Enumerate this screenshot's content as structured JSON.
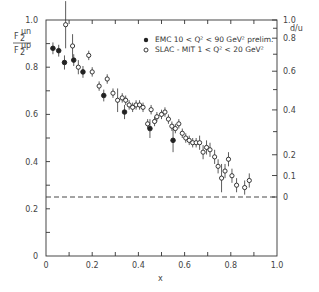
{
  "chart_data": {
    "type": "scatter",
    "title": "",
    "xlabel": "x",
    "ylabel": "F2^μn / F2^μp",
    "ylabel_num": "F",
    "ylabel_num_sub": "2",
    "ylabel_num_sup": "μn",
    "ylabel_den": "F",
    "ylabel_den_sub": "2",
    "ylabel_den_sup": "μp",
    "y2label": "d/u",
    "xlim": [
      0,
      1.0
    ],
    "ylim": [
      0,
      1.0
    ],
    "grid": false,
    "x_ticks": [
      "0",
      "0.2",
      "0.4",
      "0.6",
      "0.8",
      "1.0"
    ],
    "y_ticks": [
      "0",
      "0.2",
      "0.4",
      "0.6",
      "0.8",
      "1.0"
    ],
    "y2_ticks": [
      {
        "label": "1.0",
        "y": 1.0
      },
      {
        "label": "0.8",
        "y": 0.923
      },
      {
        "label": "0.6",
        "y": 0.783
      },
      {
        "label": "0.4",
        "y": 0.619
      },
      {
        "label": "0.2",
        "y": 0.429
      },
      {
        "label": "0.1",
        "y": 0.341
      },
      {
        "label": "0",
        "y": 0.25
      }
    ],
    "reference_line": {
      "y": 0.25,
      "style": "dashed"
    },
    "legend_position": "upper right",
    "series": [
      {
        "name": "EMC  10 < Q² < 90 GeV² prelim.",
        "marker": "filled-circle",
        "points": [
          {
            "x": 0.03,
            "y": 0.88,
            "err": 0.025
          },
          {
            "x": 0.055,
            "y": 0.87,
            "err": 0.025
          },
          {
            "x": 0.08,
            "y": 0.82,
            "err": 0.03
          },
          {
            "x": 0.12,
            "y": 0.83,
            "err": 0.025
          },
          {
            "x": 0.16,
            "y": 0.78,
            "err": 0.025
          },
          {
            "x": 0.25,
            "y": 0.68,
            "err": 0.025
          },
          {
            "x": 0.34,
            "y": 0.61,
            "err": 0.03
          },
          {
            "x": 0.45,
            "y": 0.54,
            "err": 0.04
          },
          {
            "x": 0.55,
            "y": 0.49,
            "err": 0.05
          }
        ]
      },
      {
        "name": "SLAC-MIT  1 < Q² < 20 GeV²",
        "marker": "open-circle",
        "points": [
          {
            "x": 0.085,
            "y": 0.98,
            "err": 0.1
          },
          {
            "x": 0.115,
            "y": 0.89,
            "err": 0.05
          },
          {
            "x": 0.14,
            "y": 0.8,
            "err": 0.03
          },
          {
            "x": 0.185,
            "y": 0.85,
            "err": 0.02
          },
          {
            "x": 0.2,
            "y": 0.78,
            "err": 0.02
          },
          {
            "x": 0.23,
            "y": 0.72,
            "err": 0.02
          },
          {
            "x": 0.265,
            "y": 0.75,
            "err": 0.02
          },
          {
            "x": 0.29,
            "y": 0.69,
            "err": 0.02
          },
          {
            "x": 0.31,
            "y": 0.66,
            "err": 0.05
          },
          {
            "x": 0.33,
            "y": 0.67,
            "err": 0.02
          },
          {
            "x": 0.345,
            "y": 0.66,
            "err": 0.02
          },
          {
            "x": 0.36,
            "y": 0.64,
            "err": 0.02
          },
          {
            "x": 0.375,
            "y": 0.63,
            "err": 0.02
          },
          {
            "x": 0.39,
            "y": 0.64,
            "err": 0.02
          },
          {
            "x": 0.405,
            "y": 0.64,
            "err": 0.02
          },
          {
            "x": 0.42,
            "y": 0.63,
            "err": 0.02
          },
          {
            "x": 0.44,
            "y": 0.56,
            "err": 0.02
          },
          {
            "x": 0.455,
            "y": 0.62,
            "err": 0.02
          },
          {
            "x": 0.47,
            "y": 0.57,
            "err": 0.02
          },
          {
            "x": 0.48,
            "y": 0.59,
            "err": 0.02
          },
          {
            "x": 0.5,
            "y": 0.6,
            "err": 0.02
          },
          {
            "x": 0.515,
            "y": 0.61,
            "err": 0.02
          },
          {
            "x": 0.53,
            "y": 0.58,
            "err": 0.02
          },
          {
            "x": 0.545,
            "y": 0.55,
            "err": 0.02
          },
          {
            "x": 0.56,
            "y": 0.54,
            "err": 0.02
          },
          {
            "x": 0.575,
            "y": 0.56,
            "err": 0.02
          },
          {
            "x": 0.59,
            "y": 0.52,
            "err": 0.02
          },
          {
            "x": 0.605,
            "y": 0.5,
            "err": 0.02
          },
          {
            "x": 0.62,
            "y": 0.49,
            "err": 0.02
          },
          {
            "x": 0.635,
            "y": 0.48,
            "err": 0.02
          },
          {
            "x": 0.65,
            "y": 0.48,
            "err": 0.02
          },
          {
            "x": 0.665,
            "y": 0.48,
            "err": 0.03
          },
          {
            "x": 0.68,
            "y": 0.44,
            "err": 0.03
          },
          {
            "x": 0.695,
            "y": 0.46,
            "err": 0.03
          },
          {
            "x": 0.71,
            "y": 0.45,
            "err": 0.03
          },
          {
            "x": 0.73,
            "y": 0.42,
            "err": 0.03
          },
          {
            "x": 0.745,
            "y": 0.38,
            "err": 0.03
          },
          {
            "x": 0.76,
            "y": 0.33,
            "err": 0.06
          },
          {
            "x": 0.775,
            "y": 0.36,
            "err": 0.03
          },
          {
            "x": 0.79,
            "y": 0.41,
            "err": 0.03
          },
          {
            "x": 0.805,
            "y": 0.34,
            "err": 0.03
          },
          {
            "x": 0.825,
            "y": 0.3,
            "err": 0.03
          },
          {
            "x": 0.86,
            "y": 0.29,
            "err": 0.03
          },
          {
            "x": 0.88,
            "y": 0.32,
            "err": 0.03
          }
        ]
      }
    ]
  },
  "legend": {
    "emc_label": "EMC   10 < Q² < 90 GeV² prelim.",
    "slac_label": "SLAC - MIT  1 < Q² < 20 GeV²"
  }
}
